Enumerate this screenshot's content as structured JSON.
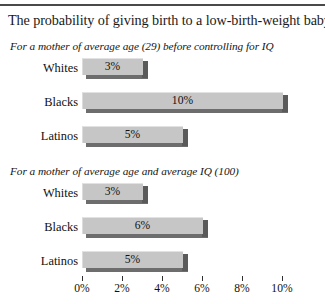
{
  "chart_data": {
    "type": "bar",
    "orientation": "horizontal",
    "title": "The probability of giving birth to a low-birth-weight baby",
    "xlabel": "",
    "ylabel": "",
    "xlim": [
      0,
      10
    ],
    "grid": false,
    "legend": null,
    "axis": {
      "tick_values": [
        0,
        2,
        4,
        6,
        8,
        10
      ],
      "tick_labels": [
        "0%",
        "2%",
        "4%",
        "6%",
        "8%",
        "10%"
      ],
      "unit": "%"
    },
    "panels": [
      {
        "subtitle": "For a mother of average age (29) before controlling for IQ",
        "categories": [
          "Whites",
          "Blacks",
          "Latinos"
        ],
        "values": [
          3,
          10,
          5
        ],
        "value_labels": [
          "3%",
          "10%",
          "5%"
        ]
      },
      {
        "subtitle": "For a mother of average age and average IQ (100)",
        "categories": [
          "Whites",
          "Blacks",
          "Latinos"
        ],
        "values": [
          3,
          6,
          5
        ],
        "value_labels": [
          "3%",
          "6%",
          "5%"
        ]
      }
    ],
    "colors": {
      "bar_face": "#c6c6c6",
      "bar_shadow": "#5a5a5a",
      "bar_bottom": "#6d6d6d",
      "text": "#101010",
      "rule": "#4a4a4a",
      "background": "#ffffff"
    }
  }
}
